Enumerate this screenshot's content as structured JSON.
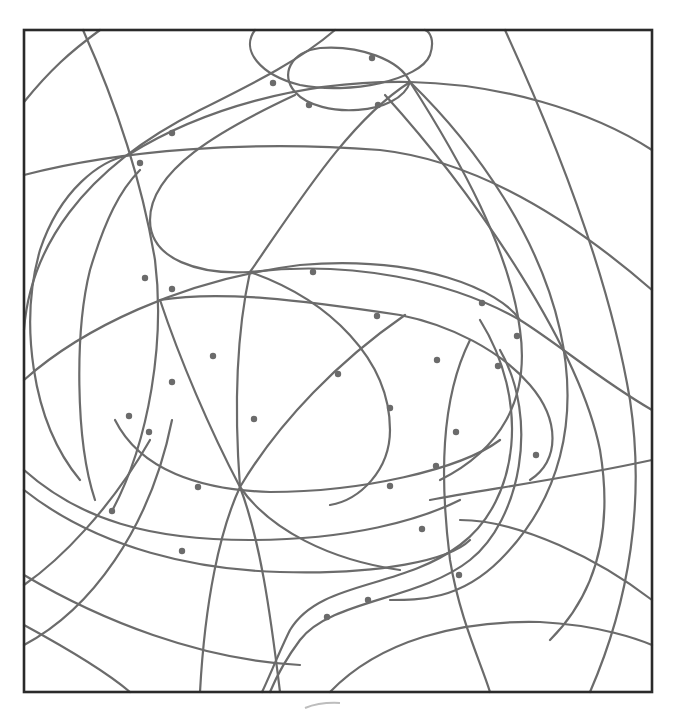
{
  "puzzle": {
    "type": "hidden-picture line drawing",
    "frame": {
      "x": 24,
      "y": 30,
      "width": 628,
      "height": 662
    },
    "line_color": "#6b6b6b",
    "frame_color": "#2a2a2a",
    "dot_count": 32,
    "dots": [
      [
        372,
        58
      ],
      [
        273,
        83
      ],
      [
        309,
        105
      ],
      [
        378,
        105
      ],
      [
        172,
        133
      ],
      [
        140,
        163
      ],
      [
        313,
        272
      ],
      [
        145,
        278
      ],
      [
        172,
        289
      ],
      [
        377,
        316
      ],
      [
        482,
        303
      ],
      [
        517,
        336
      ],
      [
        213,
        356
      ],
      [
        437,
        360
      ],
      [
        498,
        366
      ],
      [
        338,
        374
      ],
      [
        172,
        382
      ],
      [
        390,
        408
      ],
      [
        129,
        416
      ],
      [
        254,
        419
      ],
      [
        149,
        432
      ],
      [
        456,
        432
      ],
      [
        536,
        455
      ],
      [
        436,
        466
      ],
      [
        198,
        487
      ],
      [
        390,
        486
      ],
      [
        112,
        511
      ],
      [
        422,
        529
      ],
      [
        182,
        551
      ],
      [
        459,
        575
      ],
      [
        368,
        600
      ],
      [
        327,
        617
      ]
    ]
  }
}
